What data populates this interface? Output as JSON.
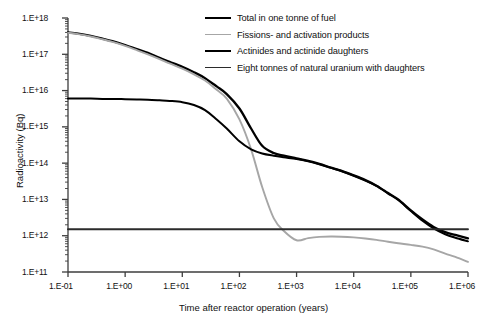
{
  "chart_data": {
    "type": "line",
    "title": "",
    "xlabel": "Time after reactor operation (years)",
    "ylabel": "Radioactivity (Bq)",
    "xscale": "log",
    "yscale": "log",
    "xlim": [
      0.1,
      1000000
    ],
    "ylim": [
      100000000000.0,
      1e+18
    ],
    "grid": false,
    "legend_position": "top-right",
    "xticklabels": [
      "1.E-01",
      "1.E+00",
      "1.E+01",
      "1.E+02",
      "1.E+03",
      "1.E+04",
      "1.E+05",
      "1.E+06"
    ],
    "xtickvalues": [
      0.1,
      1,
      10,
      100,
      1000,
      10000,
      100000,
      1000000
    ],
    "yticklabels": [
      "1.E+11",
      "1.E+12",
      "1.E+13",
      "1.E+14",
      "1.E+15",
      "1.E+16",
      "1.E+17",
      "1.E+18"
    ],
    "ytickvalues": [
      100000000000.0,
      1000000000000.0,
      10000000000000.0,
      100000000000000.0,
      1000000000000000.0,
      1e+16,
      1e+17,
      1e+18
    ],
    "series": [
      {
        "name": "Total in one tonne of fuel",
        "color": "#000000",
        "width": 2.3,
        "x": [
          0.1,
          0.15,
          0.25,
          0.4,
          0.6,
          1,
          1.6,
          2.5,
          4,
          6,
          10,
          16,
          25,
          40,
          60,
          100,
          160,
          250,
          400,
          600,
          1000,
          1600,
          2500,
          4000,
          6000,
          10000,
          16000,
          25000,
          40000,
          60000,
          100000,
          160000,
          250000,
          400000,
          600000,
          1000000
        ],
        "y": [
          4e+17,
          3.7e+17,
          3.2e+17,
          2.7e+17,
          2.3e+17,
          1.8e+17,
          1.4e+17,
          1.1e+17,
          8e+16,
          6.2e+16,
          4.5e+16,
          3.2e+16,
          2.2e+16,
          1.3e+16,
          8000000000000000.0,
          3200000000000000.0,
          900000000000000.0,
          300000000000000.0,
          190000000000000.0,
          160000000000000.0,
          135000000000000.0,
          115000000000000.0,
          95000000000000.0,
          75000000000000.0,
          62000000000000.0,
          46000000000000.0,
          34000000000000.0,
          24000000000000.0,
          15000000000000.0,
          10000000000000.0,
          5000000000000.0,
          2800000000000.0,
          1750000000000.0,
          1250000000000.0,
          1050000000000.0,
          850000000000.0
        ]
      },
      {
        "name": "Fissions- and activation products",
        "color": "#a6a6a6",
        "width": 1.9,
        "x": [
          0.1,
          0.15,
          0.25,
          0.4,
          0.6,
          1,
          1.6,
          2.5,
          4,
          6,
          10,
          16,
          25,
          40,
          60,
          100,
          160,
          250,
          400,
          600,
          1000,
          1600,
          2500,
          4000,
          6000,
          10000,
          16000,
          25000,
          40000,
          60000,
          100000,
          160000,
          250000,
          400000,
          600000,
          1000000
        ],
        "y": [
          3.9e+17,
          3.6e+17,
          3.1e+17,
          2.6e+17,
          2.2e+17,
          1.7e+17,
          1.3e+17,
          1e+17,
          7.4e+16,
          5.6e+16,
          4e+16,
          2.8e+16,
          1.9e+16,
          1.05e+16,
          6000000000000000.0,
          1600000000000000.0,
          240000000000000.0,
          22000000000000.0,
          3000000000000.0,
          1350000000000.0,
          750000000000.0,
          860000000000.0,
          930000000000.0,
          950000000000.0,
          940000000000.0,
          900000000000.0,
          840000000000.0,
          770000000000.0,
          680000000000.0,
          620000000000.0,
          560000000000.0,
          500000000000.0,
          420000000000.0,
          320000000000.0,
          260000000000.0,
          190000000000.0
        ]
      },
      {
        "name": "Actinides and actinide daughters",
        "color": "#000000",
        "width": 2.0,
        "x": [
          0.1,
          0.15,
          0.25,
          0.4,
          0.6,
          1,
          1.6,
          2.5,
          4,
          6,
          10,
          16,
          25,
          40,
          60,
          100,
          160,
          250,
          400,
          600,
          1000,
          1600,
          2500,
          4000,
          6000,
          10000,
          16000,
          25000,
          40000,
          60000,
          100000,
          160000,
          250000,
          400000,
          600000,
          1000000
        ],
        "y": [
          6000000000000000.0,
          6000000000000000.0,
          6000000000000000.0,
          5900000000000000.0,
          5900000000000000.0,
          5800000000000000.0,
          5700000000000000.0,
          5600000000000000.0,
          5400000000000000.0,
          5200000000000000.0,
          4800000000000000.0,
          4000000000000000.0,
          2900000000000000.0,
          1600000000000000.0,
          900000000000000.0,
          400000000000000.0,
          240000000000000.0,
          185000000000000.0,
          160000000000000.0,
          145000000000000.0,
          130000000000000.0,
          112000000000000.0,
          93000000000000.0,
          74000000000000.0,
          61000000000000.0,
          45000000000000.0,
          33000000000000.0,
          23500000000000.0,
          14500000000000.0,
          9600000000000.0,
          4800000000000.0,
          2600000000000.0,
          1600000000000.0,
          1100000000000.0,
          880000000000.0,
          700000000000.0
        ]
      },
      {
        "name": "Eight tonnes of natural uranium with daughters",
        "color": "#2b2b2b",
        "width": 1.9,
        "x": [
          0.1,
          1000000
        ],
        "y": [
          1500000000000.0,
          1500000000000.0
        ]
      }
    ]
  },
  "axes": {
    "ylabel": "Radioactivity (Bq)",
    "xlabel": "Time after reactor operation (years)"
  }
}
